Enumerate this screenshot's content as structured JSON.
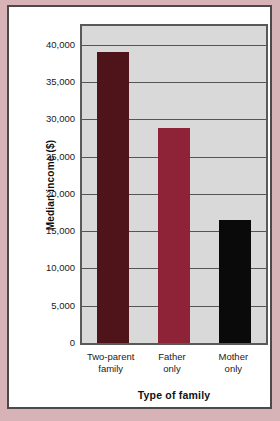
{
  "page": {
    "background_color": "#d7b2b6",
    "card_color": "#ffffff",
    "card_border_color": "#4a4a4a"
  },
  "chart_data": {
    "type": "bar",
    "title": "",
    "xlabel": "Type of family",
    "ylabel": "Median income ($)",
    "categories": [
      "Two-parent family",
      "Father only",
      "Mother only"
    ],
    "category_lines": [
      [
        "Two-parent",
        "family"
      ],
      [
        "Father",
        "only"
      ],
      [
        "Mother",
        "only"
      ]
    ],
    "values": [
      39000,
      28800,
      16500
    ],
    "bar_colors": [
      "#4e1419",
      "#8e2338",
      "#0a0a0a"
    ],
    "ylim": [
      0,
      42500
    ],
    "yticks": [
      0,
      5000,
      10000,
      15000,
      20000,
      25000,
      30000,
      35000,
      40000
    ],
    "ytick_labels": [
      "0",
      "5,000",
      "10,000",
      "15,000",
      "20,000",
      "25,000",
      "30,000",
      "35,000",
      "40,000"
    ],
    "grid": true,
    "grid_color": "#555555",
    "plot_background": "#d9d9d9",
    "plot_border_color": "#595959",
    "legend": false,
    "legend_position": "none"
  }
}
